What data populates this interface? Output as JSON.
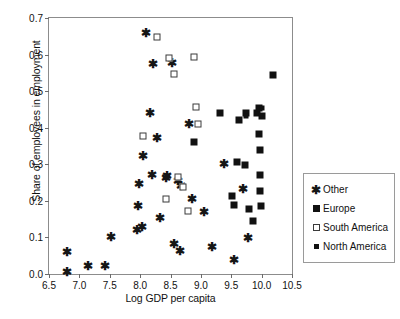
{
  "chart_data": {
    "type": "scatter",
    "title": "",
    "xlabel": "Log GDP per capita",
    "ylabel": "Share of employees in employment",
    "xlim": [
      6.5,
      10.5
    ],
    "ylim": [
      0.0,
      0.7
    ],
    "xticks": [
      "6.5",
      "7.0",
      "7.5",
      "8.0",
      "8.5",
      "9.0",
      "9.5",
      "10.0",
      "10.5"
    ],
    "xtick_values": [
      6.5,
      7.0,
      7.5,
      8.0,
      8.5,
      9.0,
      9.5,
      10.0,
      10.5
    ],
    "yticks": [
      "0.0",
      "0.1",
      "0.2",
      "0.3",
      "0.4",
      "0.5",
      "0.6",
      "0.7"
    ],
    "ytick_values": [
      0.0,
      0.1,
      0.2,
      0.3,
      0.4,
      0.5,
      0.6,
      0.7
    ],
    "grid": false,
    "legend_position": "right-outside",
    "series": [
      {
        "name": "Other",
        "marker": "asterisk",
        "color": "#161616",
        "points": [
          [
            6.8,
            0.06
          ],
          [
            6.8,
            0.005
          ],
          [
            7.15,
            0.022
          ],
          [
            7.42,
            0.022
          ],
          [
            7.52,
            0.102
          ],
          [
            7.95,
            0.12
          ],
          [
            7.97,
            0.185
          ],
          [
            7.98,
            0.245
          ],
          [
            8.03,
            0.128
          ],
          [
            8.05,
            0.322
          ],
          [
            8.1,
            0.66
          ],
          [
            8.17,
            0.44
          ],
          [
            8.2,
            0.27
          ],
          [
            8.22,
            0.573
          ],
          [
            8.28,
            0.372
          ],
          [
            8.32,
            0.152
          ],
          [
            8.42,
            0.262
          ],
          [
            8.45,
            0.268
          ],
          [
            8.52,
            0.578
          ],
          [
            8.55,
            0.082
          ],
          [
            8.62,
            0.255
          ],
          [
            8.65,
            0.062
          ],
          [
            8.68,
            0.24
          ],
          [
            8.8,
            0.41
          ],
          [
            8.85,
            0.205
          ],
          [
            9.05,
            0.17
          ],
          [
            9.18,
            0.075
          ],
          [
            9.38,
            0.3
          ],
          [
            9.55,
            0.038
          ],
          [
            9.7,
            0.232
          ],
          [
            9.78,
            0.098
          ]
        ]
      },
      {
        "name": "Europe",
        "marker": "filled-square",
        "color": "#111111",
        "points": [
          [
            8.88,
            0.362
          ],
          [
            9.32,
            0.44
          ],
          [
            9.52,
            0.212
          ],
          [
            9.55,
            0.19
          ],
          [
            9.6,
            0.305
          ],
          [
            9.62,
            0.42
          ],
          [
            9.72,
            0.298
          ],
          [
            9.75,
            0.44
          ],
          [
            9.8,
            0.178
          ],
          [
            9.85,
            0.145
          ],
          [
            9.92,
            0.44
          ],
          [
            9.95,
            0.455
          ],
          [
            9.96,
            0.382
          ],
          [
            9.97,
            0.34
          ],
          [
            9.98,
            0.272
          ],
          [
            9.98,
            0.228
          ],
          [
            9.99,
            0.185
          ],
          [
            10.0,
            0.432
          ],
          [
            10.18,
            0.545
          ]
        ]
      },
      {
        "name": "South America",
        "marker": "open-square",
        "color": "#3a3a3a",
        "points": [
          [
            8.05,
            0.378
          ],
          [
            8.28,
            0.648
          ],
          [
            8.42,
            0.205
          ],
          [
            8.48,
            0.59
          ],
          [
            8.55,
            0.548
          ],
          [
            8.62,
            0.265
          ],
          [
            8.7,
            0.238
          ],
          [
            8.78,
            0.172
          ],
          [
            8.88,
            0.592
          ],
          [
            8.92,
            0.458
          ],
          [
            8.95,
            0.41
          ]
        ]
      },
      {
        "name": "North America",
        "marker": "small-filled-square",
        "color": "#111111",
        "points": [
          [
            9.75,
            0.432
          ],
          [
            10.0,
            0.455
          ]
        ]
      }
    ]
  },
  "legend": {
    "items": [
      {
        "label": "Other",
        "key": "asterisk-marker"
      },
      {
        "label": "Europe",
        "key": "filled-square-marker"
      },
      {
        "label": "South America",
        "key": "open-square-marker"
      },
      {
        "label": "North America",
        "key": "small-filled-square-marker"
      }
    ]
  },
  "axes": {
    "x_title": "Log GDP per capita",
    "y_title": "Share of employees in employment"
  }
}
